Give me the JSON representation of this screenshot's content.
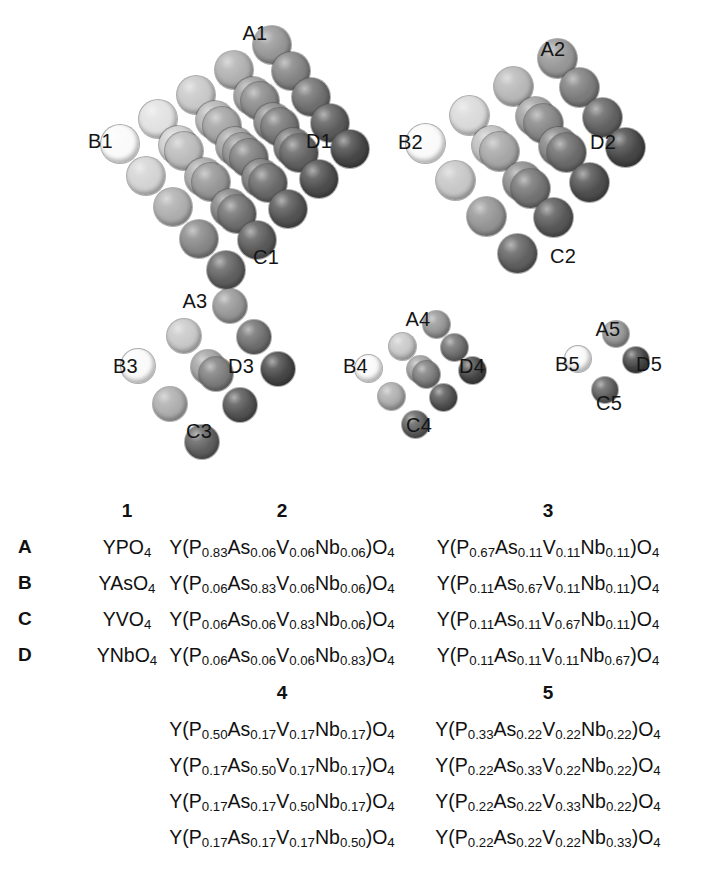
{
  "figure": {
    "clusters": [
      {
        "id": "cluster-1",
        "vertices": {
          "a": "A1",
          "b": "B1",
          "c": "C1",
          "d": "D1"
        },
        "sphere_count": 35,
        "size_rank": 1
      },
      {
        "id": "cluster-2",
        "vertices": {
          "a": "A2",
          "b": "B2",
          "c": "C2",
          "d": "D2"
        },
        "sphere_count": 25,
        "size_rank": 2
      },
      {
        "id": "cluster-3",
        "vertices": {
          "a": "A3",
          "b": "B3",
          "c": "C3",
          "d": "D3"
        },
        "sphere_count": 15,
        "size_rank": 3
      },
      {
        "id": "cluster-4",
        "vertices": {
          "a": "A4",
          "b": "B4",
          "c": "C4",
          "d": "D4"
        },
        "sphere_count": 9,
        "size_rank": 4
      },
      {
        "id": "cluster-5",
        "vertices": {
          "a": "A5",
          "b": "B5",
          "c": "C5",
          "d": "D5"
        },
        "sphere_count": 4,
        "size_rank": 5
      }
    ]
  },
  "table_top": {
    "headers": [
      "1",
      "2",
      "3"
    ],
    "row_labels": [
      "A",
      "B",
      "C",
      "D"
    ],
    "rows": [
      {
        "label": "A",
        "col1": "YPO<sub>4</sub>",
        "col2": "Y(P<sub>0.83</sub>As<sub>0.06</sub>V<sub>0.06</sub>Nb<sub>0.06</sub>)O<sub>4</sub>",
        "col3": "Y(P<sub>0.67</sub>As<sub>0.11</sub>V<sub>0.11</sub>Nb<sub>0.11</sub>)O<sub>4</sub>"
      },
      {
        "label": "B",
        "col1": "YAsO<sub>4</sub>",
        "col2": "Y(P<sub>0.06</sub>As<sub>0.83</sub>V<sub>0.06</sub>Nb<sub>0.06</sub>)O<sub>4</sub>",
        "col3": "Y(P<sub>0.11</sub>As<sub>0.67</sub>V<sub>0.11</sub>Nb<sub>0.11</sub>)O<sub>4</sub>"
      },
      {
        "label": "C",
        "col1": "YVO<sub>4</sub>",
        "col2": "Y(P<sub>0.06</sub>As<sub>0.06</sub>V<sub>0.83</sub>Nb<sub>0.06</sub>)O<sub>4</sub>",
        "col3": "Y(P<sub>0.11</sub>As<sub>0.11</sub>V<sub>0.67</sub>Nb<sub>0.11</sub>)O<sub>4</sub>"
      },
      {
        "label": "D",
        "col1": "YNbO<sub>4</sub>",
        "col2": "Y(P<sub>0.06</sub>As<sub>0.06</sub>V<sub>0.06</sub>Nb<sub>0.83</sub>)O<sub>4</sub>",
        "col3": "Y(P<sub>0.11</sub>As<sub>0.11</sub>V<sub>0.11</sub>Nb<sub>0.67</sub>)O<sub>4</sub>"
      }
    ]
  },
  "table_bottom": {
    "headers": [
      "4",
      "5"
    ],
    "rows": [
      {
        "col4": "Y(P<sub>0.50</sub>As<sub>0.17</sub>V<sub>0.17</sub>Nb<sub>0.17</sub>)O<sub>4</sub>",
        "col5": "Y(P<sub>0.33</sub>As<sub>0.22</sub>V<sub>0.22</sub>Nb<sub>0.22</sub>)O<sub>4</sub>"
      },
      {
        "col4": "Y(P<sub>0.17</sub>As<sub>0.50</sub>V<sub>0.17</sub>Nb<sub>0.17</sub>)O<sub>4</sub>",
        "col5": "Y(P<sub>0.22</sub>As<sub>0.33</sub>V<sub>0.22</sub>Nb<sub>0.22</sub>)O<sub>4</sub>"
      },
      {
        "col4": "Y(P<sub>0.17</sub>As<sub>0.17</sub>V<sub>0.50</sub>Nb<sub>0.17</sub>)O<sub>4</sub>",
        "col5": "Y(P<sub>0.22</sub>As<sub>0.22</sub>V<sub>0.33</sub>Nb<sub>0.22</sub>)O<sub>4</sub>"
      },
      {
        "col4": "Y(P<sub>0.17</sub>As<sub>0.17</sub>V<sub>0.17</sub>Nb<sub>0.50</sub>)O<sub>4</sub>",
        "col5": "Y(P<sub>0.22</sub>As<sub>0.22</sub>V<sub>0.22</sub>Nb<sub>0.33</sub>)O<sub>4</sub>"
      }
    ]
  }
}
